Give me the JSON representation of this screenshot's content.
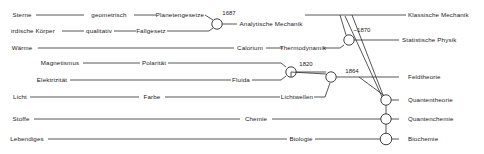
{
  "diagram": {
    "stroke_color": "#2b2b2b",
    "text_color": "#1a1a1a",
    "node_fill": "#ffffff",
    "labels": {
      "sterne": "Sterne",
      "geometrisch": "geometrisch",
      "planetengesetze": "Planetengesetze",
      "irdische_koerper": "irdische Körper",
      "qualitativ": "qualitativ",
      "fallgesetz": "Fallgesetz",
      "analytische_mechanik": "Analytische  Mechanik",
      "klassische_mechanik": "Klassische  Mechanik",
      "waerme": "Wärme",
      "calorium": "Calorium",
      "thermodynamik": "Thermodynamik",
      "statistische_physik": "Statistische Physik",
      "magnetismus": "Magnetismus",
      "polaritaet": "Polarität",
      "elektrizitaet": "Elektrizität",
      "fluida": "Fluida",
      "feldtheorie": "Feldtheorie",
      "licht": "Licht",
      "farbe": "Farbe",
      "lichtwellen": "Lichtwellen",
      "quantentheorie": "Quantentheorie",
      "stoffe": "Stoffe",
      "chemie": "Chemie",
      "quantenchemie": "Quantenchemie",
      "lebendiges": "Lebendiges",
      "biologie": "Biologie",
      "biochemie": "Biochemie"
    },
    "years": {
      "y1687": "1687",
      "y1870": "~1870",
      "y1820": "1820",
      "y1864": "1864"
    }
  }
}
